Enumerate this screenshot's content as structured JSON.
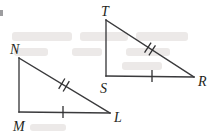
{
  "figure": {
    "background_color": "#ffffff",
    "line_color": "#3a3a3c",
    "label_color": "#231f20",
    "width": 215,
    "height": 139
  },
  "triangles": [
    {
      "name": "triangle-MNL",
      "vertices": [
        {
          "label": "N",
          "x": 19,
          "y": 58,
          "label_x": 10,
          "label_y": 54
        },
        {
          "label": "M",
          "x": 19,
          "y": 112,
          "label_x": 13,
          "label_y": 131
        },
        {
          "label": "L",
          "x": 110,
          "y": 113,
          "label_x": 114,
          "label_y": 122
        }
      ],
      "edges": [
        {
          "name": "edge-NM",
          "from": "N",
          "to": "M",
          "ticks": 0
        },
        {
          "name": "edge-ML",
          "from": "M",
          "to": "L",
          "ticks": 1
        },
        {
          "name": "edge-NL",
          "from": "N",
          "to": "L",
          "ticks": 2
        }
      ]
    },
    {
      "name": "triangle-STR",
      "vertices": [
        {
          "label": "T",
          "x": 106,
          "y": 20,
          "label_x": 101,
          "label_y": 16
        },
        {
          "label": "S",
          "x": 106,
          "y": 76,
          "label_x": 100,
          "label_y": 93
        },
        {
          "label": "R",
          "x": 194,
          "y": 77,
          "label_x": 198,
          "label_y": 86
        }
      ],
      "edges": [
        {
          "name": "edge-TS",
          "from": "T",
          "to": "S",
          "ticks": 0
        },
        {
          "name": "edge-SR",
          "from": "S",
          "to": "R",
          "ticks": 1
        },
        {
          "name": "edge-TR",
          "from": "T",
          "to": "R",
          "ticks": 2
        }
      ]
    }
  ],
  "tick_marks": [
    {
      "name": "tick-ML-single",
      "x": 63,
      "y": 112,
      "count": 1,
      "angle": 90
    },
    {
      "name": "tick-NL-double",
      "x": 64,
      "y": 85,
      "count": 2,
      "angle": 121
    },
    {
      "name": "tick-SR-single",
      "x": 152,
      "y": 76,
      "count": 1,
      "angle": 90
    },
    {
      "name": "tick-TR-double",
      "x": 150,
      "y": 49,
      "count": 2,
      "angle": 122
    }
  ],
  "labels": {
    "N": "N",
    "M": "M",
    "L": "L",
    "T": "T",
    "S": "S",
    "R": "R"
  }
}
